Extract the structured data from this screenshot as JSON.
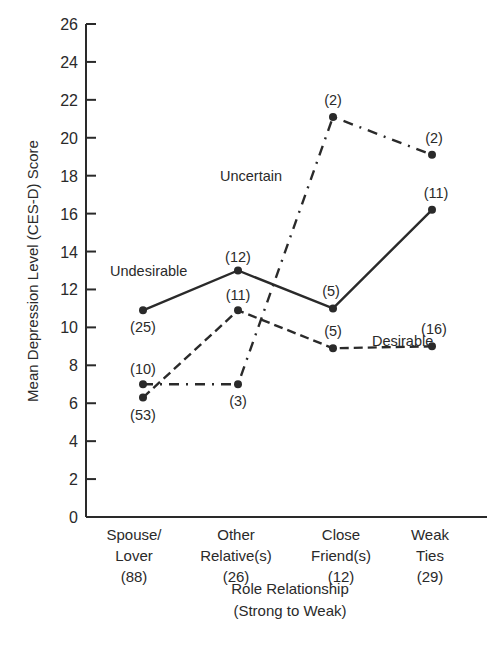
{
  "chart_data": {
    "type": "line",
    "title": "",
    "xlabel": "Role Relationship (Strong to Weak)",
    "xlabel_lines": [
      "Role Relationship",
      "(Strong to Weak)"
    ],
    "ylabel": "Mean Depression Level (CES-D) Score",
    "ylim": [
      0,
      26
    ],
    "yticks": [
      0,
      2,
      4,
      6,
      8,
      10,
      12,
      14,
      16,
      18,
      20,
      22,
      24,
      26
    ],
    "grid": false,
    "categories": [
      "Spouse/Lover (88)",
      "Other Relative(s) (26)",
      "Close Friend(s) (12)",
      "Weak Ties (29)"
    ],
    "category_lines": [
      [
        "Spouse/",
        "Lover",
        "(88)"
      ],
      [
        "Other",
        "Relative(s)",
        "(26)"
      ],
      [
        "Close",
        "Friend(s)",
        "(12)"
      ],
      [
        "Weak",
        "Ties",
        "(29)"
      ]
    ],
    "series": [
      {
        "name": "Undesirable",
        "style": "solid",
        "values": [
          10.9,
          13.0,
          11.0,
          16.2
        ],
        "n": [
          "(25)",
          "(12)",
          "(5)",
          "(11)"
        ]
      },
      {
        "name": "Desirable",
        "style": "dashed",
        "values": [
          6.3,
          10.9,
          8.9,
          9.0
        ],
        "n": [
          "(53)",
          "(11)",
          "(5)",
          "(16)"
        ]
      },
      {
        "name": "Uncertain",
        "style": "dash-dot",
        "values": [
          7.0,
          7.0,
          21.1,
          19.1
        ],
        "n": [
          "(10)",
          "(3)",
          "(2)",
          "(2)"
        ]
      }
    ],
    "legend_position": "inline labels"
  }
}
